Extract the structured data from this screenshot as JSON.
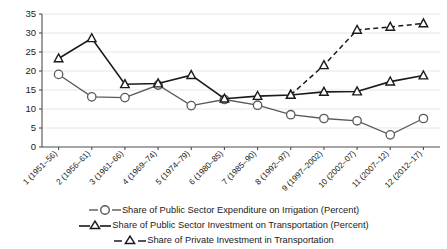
{
  "chart_data": {
    "type": "line",
    "title": "",
    "xlabel": "",
    "ylabel": "",
    "ylim": [
      0,
      35
    ],
    "yticks": [
      0,
      5,
      10,
      15,
      20,
      25,
      30,
      35
    ],
    "grid": true,
    "legend_position": "bottom",
    "categories": [
      "1 (1951–56)",
      "2 (1956–61)",
      "3 (1961–66)",
      "4 (1969–74)",
      "5 (1974–79)",
      "6 (1980–85)",
      "7 (1985–90)",
      "8 (1992–97)",
      "9 (1997–2002)",
      "10 (2002–07)",
      "11 (2007–12)",
      "12 (2012–17)"
    ],
    "series": [
      {
        "name": "Share of Public Sector Expenditure on Irrigation (Percent)",
        "marker": "circle",
        "line_style": "solid",
        "color": "#595959",
        "values": [
          19.1,
          13.2,
          13.0,
          16.3,
          10.9,
          12.5,
          11.0,
          8.5,
          7.5,
          6.9,
          3.2,
          7.5
        ]
      },
      {
        "name": "Share of Public Sector Investment on Transportation (Percent)",
        "marker": "triangle",
        "line_style": "solid",
        "color": "#1a1a1a",
        "values": [
          23.3,
          28.6,
          16.5,
          16.7,
          18.9,
          12.7,
          13.4,
          13.7,
          14.5,
          14.6,
          17.2,
          18.8
        ]
      },
      {
        "name": "Share of Private Investment in Transportation",
        "marker": "triangle",
        "line_style": "dashed",
        "color": "#1a1a1a",
        "values": [
          null,
          null,
          null,
          null,
          null,
          null,
          null,
          13.7,
          21.5,
          30.8,
          31.6,
          32.5
        ]
      }
    ]
  },
  "colors": {
    "grid": "#e6e6e6",
    "axis": "#4d4d4d",
    "series_irrigation": "#595959",
    "series_public_transport": "#1a1a1a",
    "series_private_transport": "#1a1a1a",
    "background": "#ffffff"
  }
}
